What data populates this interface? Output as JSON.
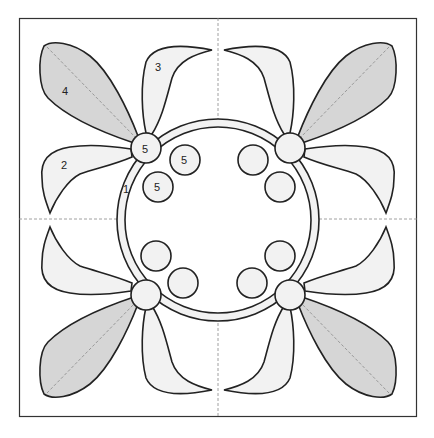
{
  "diagram": {
    "type": "applique quilt block pattern",
    "colors": {
      "outline": "#222222",
      "light_fill": "#f2f2f2",
      "dark_fill": "#d6d6d6",
      "dash": "#888888",
      "background": "#ffffff"
    },
    "labels": {
      "ring": "1",
      "petal_small_left": "2",
      "petal_small_top": "3",
      "leaf_large": "4",
      "flower_center": "5",
      "berry_a": "5",
      "berry_b": "5"
    }
  }
}
